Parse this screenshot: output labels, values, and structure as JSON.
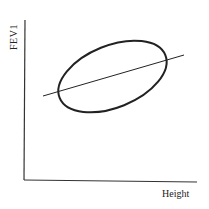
{
  "diagram": {
    "y_axis_label": "FEV1",
    "x_axis_label": "Height",
    "elements": [
      {
        "type": "axis",
        "name": "y-axis"
      },
      {
        "type": "axis",
        "name": "x-axis"
      },
      {
        "type": "ellipse",
        "name": "data-ellipse",
        "description": "tilted ellipse representing joint distribution"
      },
      {
        "type": "line",
        "name": "regression-line",
        "description": "straight line through the ellipse, positive slope"
      }
    ],
    "colors": {
      "stroke": "#222222",
      "background": "#ffffff"
    }
  }
}
